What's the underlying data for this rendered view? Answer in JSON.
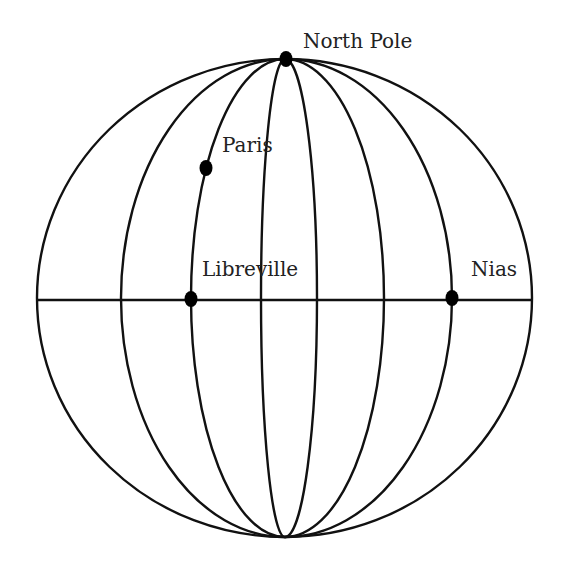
{
  "diagram": {
    "center": {
      "x": 285,
      "y": 298
    },
    "radius_x": 248,
    "radius_y": 239,
    "stroke_color": "#111111",
    "background": "#ffffff",
    "equator": {
      "x1": 37,
      "x2": 532,
      "y": 300
    },
    "meridian_offsets": [
      -248,
      -164,
      -94,
      -24,
      32,
      99,
      167,
      247
    ],
    "points": [
      {
        "id": "north-pole",
        "label": "North Pole",
        "x": 286,
        "y": 59,
        "label_x": 303,
        "label_y": 48
      },
      {
        "id": "paris",
        "label": "Paris",
        "x": 206,
        "y": 168,
        "label_x": 222,
        "label_y": 152
      },
      {
        "id": "libreville",
        "label": "Libreville",
        "x": 191,
        "y": 299,
        "label_x": 202,
        "label_y": 276
      },
      {
        "id": "nias",
        "label": "Nias",
        "x": 452,
        "y": 298,
        "label_x": 471,
        "label_y": 276
      }
    ]
  }
}
